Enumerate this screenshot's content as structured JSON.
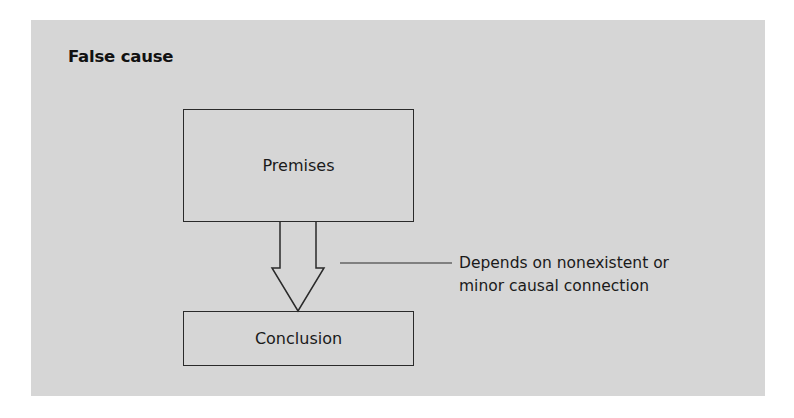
{
  "diagram": {
    "title": "False cause",
    "nodes": [
      {
        "id": "premises",
        "label": "Premises"
      },
      {
        "id": "conclusion",
        "label": "Conclusion"
      }
    ],
    "edge": {
      "from": "premises",
      "to": "conclusion",
      "style": "hollow-block-arrow"
    },
    "annotation": {
      "line1": "Depends on nonexistent or",
      "line2": "minor causal connection"
    }
  },
  "colors": {
    "panel_background": "#d6d6d6",
    "stroke": "#2a2a2a",
    "text": "#1a1a1a"
  }
}
